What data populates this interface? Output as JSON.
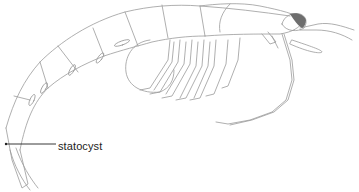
{
  "figure": {
    "labels": [
      {
        "text": "statocyst",
        "target": "uropod/statocyst region at tail"
      }
    ],
    "colors": {
      "line": "#9a9a9a",
      "eye": "#6e6e6e",
      "leader_line": "#222222",
      "background": "#ffffff"
    }
  }
}
